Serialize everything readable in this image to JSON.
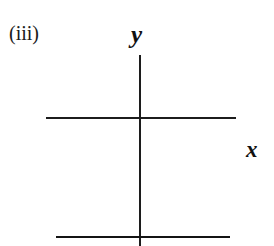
{
  "figure": {
    "part_label": "(iii)",
    "background_color": "#ffffff",
    "ink_color": "#1c1c1c",
    "labels": {
      "y_axis": "y",
      "x_axis": "x"
    }
  },
  "chart_data": {
    "type": "line",
    "title": "(iii)",
    "subtitle": "",
    "xlabel": "x",
    "ylabel": "y",
    "grid": false,
    "legend": null,
    "axes": {
      "x_axis": {
        "label": "x",
        "orientation": "horizontal",
        "drawn": true,
        "pixel_y": 118,
        "pixel_x_start": 46,
        "pixel_x_end": 236,
        "stroke_width": 1.4
      },
      "y_axis": {
        "label": "y",
        "orientation": "vertical",
        "drawn": true,
        "pixel_x": 140,
        "pixel_y_start": 55,
        "pixel_y_end": 246,
        "stroke_width": 1.6
      }
    },
    "series": [
      {
        "name": "horizontal line below x-axis",
        "kind": "horizontal-line",
        "stroke_width": 2.3,
        "pixel_y": 237,
        "pixel_x_start": 56,
        "pixel_x_end": 230,
        "points": [
          {
            "x_px": 56,
            "y_px": 237
          },
          {
            "x_px": 230,
            "y_px": 237
          }
        ]
      }
    ],
    "annotations": [
      {
        "text": "(iii)",
        "role": "part-label",
        "x_px": 10,
        "y_px": 33
      },
      {
        "text": "y",
        "role": "axis-label",
        "x_px": 139,
        "y_px": 35
      },
      {
        "text": "x",
        "role": "axis-label",
        "x_px": 254,
        "y_px": 150
      }
    ]
  }
}
